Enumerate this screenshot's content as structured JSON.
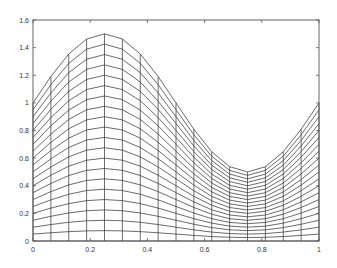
{
  "chart_data": {
    "type": "line",
    "title": "",
    "xlabel": "",
    "ylabel": "",
    "xlim": [
      0,
      1
    ],
    "ylim": [
      0,
      1.6
    ],
    "grid": false,
    "legend": null,
    "x_ticks": [
      "0",
      "0.2",
      "0.4",
      "0.6",
      "0.8",
      "1"
    ],
    "x_tick_values": [
      0,
      0.2,
      0.4,
      0.6,
      0.8,
      1
    ],
    "y_ticks": [
      "0",
      "0.2",
      "0.4",
      "0.6",
      "0.8",
      "1",
      "1.2",
      "1.4",
      "1.6"
    ],
    "y_tick_values": [
      0,
      0.2,
      0.4,
      0.6,
      0.8,
      1,
      1.2,
      1.4,
      1.6
    ],
    "x": [
      0,
      0.0625,
      0.125,
      0.1875,
      0.25,
      0.3125,
      0.375,
      0.4375,
      0.5,
      0.5625,
      0.625,
      0.6875,
      0.75,
      0.8125,
      0.875,
      0.9375,
      1
    ],
    "top_curve": [
      1.0,
      1.191,
      1.354,
      1.462,
      1.5,
      1.462,
      1.354,
      1.191,
      1.0,
      0.809,
      0.646,
      0.538,
      0.5,
      0.538,
      0.646,
      0.809,
      1.0
    ],
    "scale_levels": [
      0,
      0.05,
      0.1,
      0.15,
      0.2,
      0.25,
      0.3,
      0.35,
      0.4,
      0.45,
      0.5,
      0.55,
      0.6,
      0.65,
      0.7,
      0.75,
      0.8,
      0.85,
      0.9,
      0.95,
      1.0
    ]
  },
  "plot_area": {
    "left": 33,
    "top": 20,
    "right": 319,
    "bottom": 241
  }
}
